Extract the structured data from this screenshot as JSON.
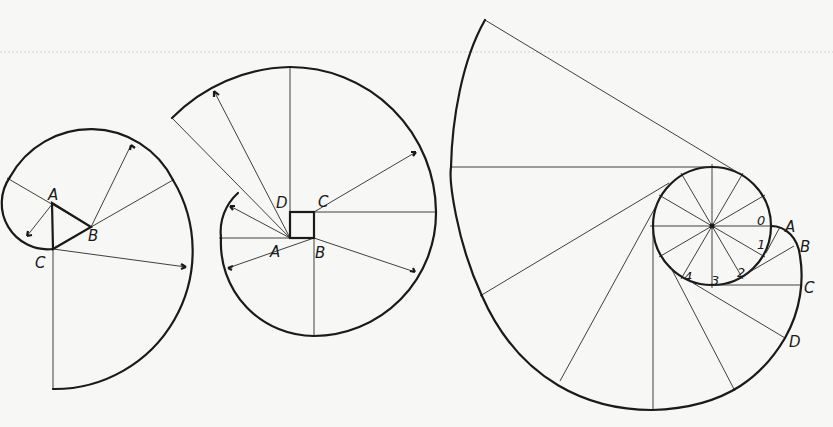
{
  "figures": [
    {
      "id": "triangle-involute",
      "description": "Spiral drawn from an equilateral triangle ABC",
      "labels": [
        {
          "text": "A",
          "x": 48,
          "y": 200
        },
        {
          "text": "B",
          "x": 90,
          "y": 240
        },
        {
          "text": "C",
          "x": 36,
          "y": 267
        }
      ],
      "points": {
        "A": [
          52,
          203
        ],
        "B": [
          91,
          227
        ],
        "C": [
          53,
          249
        ]
      }
    },
    {
      "id": "square-involute",
      "description": "Spiral drawn from a square ABCD",
      "labels": [
        {
          "text": "D",
          "x": 276,
          "y": 208
        },
        {
          "text": "C",
          "x": 318,
          "y": 207
        },
        {
          "text": "A",
          "x": 270,
          "y": 257
        },
        {
          "text": "B",
          "x": 315,
          "y": 258
        }
      ],
      "points": {
        "A": [
          290,
          238
        ],
        "B": [
          314,
          238
        ],
        "C": [
          314,
          212
        ],
        "D": [
          290,
          212
        ]
      }
    },
    {
      "id": "circle-involute",
      "description": "Involute of a circle divided into 12 parts",
      "center": [
        712,
        226
      ],
      "radius": 59,
      "labels": [
        {
          "text": "A",
          "x": 787,
          "y": 231
        },
        {
          "text": "B",
          "x": 801,
          "y": 251
        },
        {
          "text": "C",
          "x": 804,
          "y": 292
        },
        {
          "text": "D",
          "x": 789,
          "y": 347
        }
      ],
      "division_labels": [
        {
          "text": "0",
          "x": 758,
          "y": 225
        },
        {
          "text": "1",
          "x": 758,
          "y": 248
        },
        {
          "text": "2",
          "x": 739,
          "y": 276
        },
        {
          "text": "3",
          "x": 711,
          "y": 285
        },
        {
          "text": "4",
          "x": 684,
          "y": 281
        }
      ]
    }
  ]
}
